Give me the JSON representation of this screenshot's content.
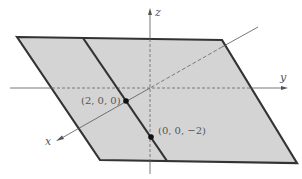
{
  "diagram": {
    "type": "3d-plane-in-coordinate-axes",
    "colors": {
      "plane_fill": "#d4d4d4",
      "plane_edge": "#333333",
      "axis": "#555555",
      "point": "#111111",
      "background": "#ffffff"
    },
    "axes": {
      "x_label": "x",
      "y_label": "y",
      "z_label": "z"
    },
    "points": [
      {
        "label": "(2, 0, 0)"
      },
      {
        "label": "(0, 0, −2)"
      }
    ]
  }
}
